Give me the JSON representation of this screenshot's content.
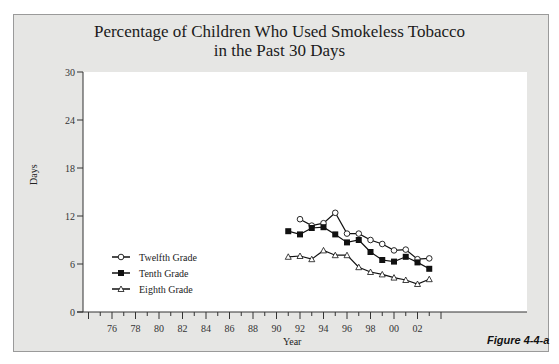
{
  "figure_label": "Figure 4-4-a",
  "chart_data": {
    "type": "line",
    "title": "Percentage of Children Who Used Smokeless Tobacco in the Past 30 Days",
    "title_lines": [
      "Percentage of Children Who Used Smokeless Tobacco",
      "in the Past 30 Days"
    ],
    "xlabel": "Year",
    "ylabel": "Days",
    "ylim": [
      0,
      30
    ],
    "yticks": [
      0,
      6,
      12,
      18,
      24,
      30
    ],
    "xtick_labels": [
      "76",
      "78",
      "80",
      "82",
      "84",
      "86",
      "88",
      "90",
      "92",
      "94",
      "96",
      "98",
      "00",
      "02"
    ],
    "grid": false,
    "legend_position": "lower-left",
    "x": [
      1991,
      1992,
      1993,
      1994,
      1995,
      1996,
      1997,
      1998,
      1999,
      2000,
      2001,
      2002,
      2003
    ],
    "series": [
      {
        "name": "Twelfth Grade",
        "marker": "open-circle",
        "values": [
          null,
          11.6,
          10.8,
          11.1,
          12.4,
          9.8,
          9.8,
          9.0,
          8.5,
          7.7,
          7.8,
          6.6,
          6.7
        ]
      },
      {
        "name": "Tenth Grade",
        "marker": "filled-square",
        "values": [
          10.1,
          9.7,
          10.5,
          10.6,
          9.7,
          8.7,
          9.0,
          7.5,
          6.5,
          6.3,
          6.9,
          6.2,
          5.4
        ]
      },
      {
        "name": "Eighth Grade",
        "marker": "open-triangle",
        "values": [
          6.9,
          7.0,
          6.6,
          7.7,
          7.1,
          7.1,
          5.6,
          5.0,
          4.7,
          4.3,
          4.0,
          3.5,
          4.1
        ]
      }
    ]
  }
}
